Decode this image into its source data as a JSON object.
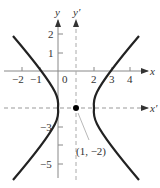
{
  "figure": {
    "equation": "(x-1)^2 - 3(y+2)^2/4 = 1",
    "axes": {
      "x_label": "x",
      "y_label": "y",
      "x_prime_label": "x′",
      "y_prime_label": "y′"
    },
    "x_ticks": [
      {
        "value": -2,
        "label": "−2"
      },
      {
        "value": -1,
        "label": "−1"
      },
      {
        "value": 0,
        "label": "0"
      },
      {
        "value": 2,
        "label": "2"
      },
      {
        "value": 3,
        "label": "3"
      },
      {
        "value": 4,
        "label": "4"
      }
    ],
    "y_ticks": [
      {
        "value": 2,
        "label": "2"
      },
      {
        "value": 1,
        "label": "1"
      },
      {
        "value": -3,
        "label": "−3"
      },
      {
        "value": -5,
        "label": "−5"
      }
    ],
    "center_point": {
      "x": 1,
      "y": -2,
      "label": "(1, −2)"
    },
    "colors": {
      "curve": "#222222",
      "axes": "#888888",
      "dashed": "#999999",
      "point": "#000000"
    }
  }
}
